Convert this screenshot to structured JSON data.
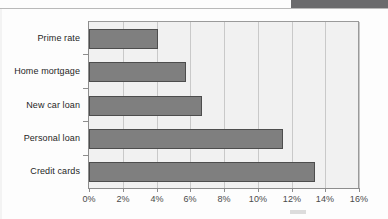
{
  "page": {
    "background_color": "#fdfdfd",
    "top_band_color": "#6b6b6d",
    "smudge_color": "#dcdcdc"
  },
  "chart_data": {
    "type": "bar",
    "orientation": "horizontal",
    "title": "",
    "xlabel": "",
    "ylabel": "",
    "categories": [
      "Prime rate",
      "Home mortgage",
      "New car loan",
      "Personal loan",
      "Credit cards"
    ],
    "values": [
      4.1,
      5.75,
      6.7,
      11.5,
      13.4
    ],
    "xlim": [
      0,
      16
    ],
    "xtick_values": [
      0,
      2,
      4,
      6,
      8,
      10,
      12,
      14,
      16
    ],
    "xtick_labels": [
      "0%",
      "2%",
      "4%",
      "6%",
      "8%",
      "10%",
      "12%",
      "14%",
      "16%"
    ],
    "grid": "vertical",
    "legend": "none",
    "bar_fill_color": "#7f7f7f",
    "bar_border_color": "#4d4d4d",
    "plot_background_color": "#f1f1f1",
    "gridline_color": "#c9c9c9",
    "axis_color": "#8d8d8d"
  }
}
